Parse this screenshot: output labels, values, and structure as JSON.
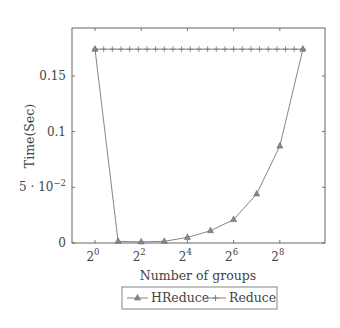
{
  "chart_data": {
    "type": "line",
    "title": "",
    "xlabel": "Number of groups",
    "ylabel": "Time(Sec)",
    "xscale": "log2",
    "x": [
      1,
      2,
      4,
      8,
      16,
      32,
      64,
      128,
      256,
      512
    ],
    "x_tick_labels": [
      "2^0",
      "2^2",
      "2^4",
      "2^6",
      "2^8"
    ],
    "x_tick_exponents": [
      0,
      2,
      4,
      6,
      8
    ],
    "y_tick_labels": [
      "0",
      "5 · 10^-2",
      "0.1",
      "0.15"
    ],
    "y_tick_values": [
      0,
      0.05,
      0.1,
      0.15
    ],
    "xlim_exponent": [
      -0.95,
      10.0
    ],
    "ylim": [
      0,
      0.2
    ],
    "grid": false,
    "legend_position": "below",
    "series": [
      {
        "name": "HReduce",
        "marker": "triangle",
        "values": [
          0.174,
          0.0015,
          0.001,
          0.0015,
          0.005,
          0.011,
          0.021,
          0.044,
          0.087,
          0.174
        ]
      },
      {
        "name": "Reduce",
        "marker": "plus",
        "constant_value": 0.174,
        "marker_count": 25,
        "x_range_exponent": [
          0,
          9
        ]
      }
    ]
  },
  "legend": {
    "items": [
      {
        "label": "HReduce"
      },
      {
        "label": "Reduce"
      }
    ]
  },
  "colors": {
    "line": "#777777",
    "axis": "#555555",
    "text": "#444444"
  }
}
